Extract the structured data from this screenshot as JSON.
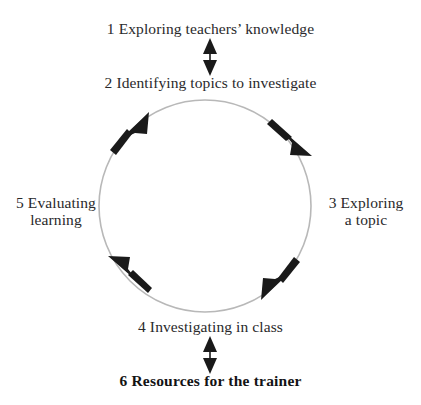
{
  "diagram": {
    "type": "cyclical-process",
    "colors": {
      "background": "#ffffff",
      "circle_stroke": "#b8b8b8",
      "arrow_fill": "#1a1a1a",
      "text": "#29292b",
      "text_emphasis": "#131314"
    },
    "circle": {
      "center_x": 205,
      "center_y": 206,
      "radius": 106,
      "direction": "clockwise",
      "arrowhead_angles_deg": [
        315,
        45,
        135,
        225
      ]
    },
    "steps": [
      {
        "number": "1",
        "label": "1 Exploring teachers’ knowledge",
        "position": "top",
        "emphasis": "regular"
      },
      {
        "number": "2",
        "label": "2 Identifying topics to investigate",
        "position": "upper",
        "emphasis": "regular"
      },
      {
        "number": "3",
        "label": "3 Exploring\na topic",
        "position": "right",
        "emphasis": "regular"
      },
      {
        "number": "4",
        "label": "4 Investigating in class",
        "position": "bottom",
        "emphasis": "regular"
      },
      {
        "number": "5",
        "label": "5 Evaluating\nlearning",
        "position": "left",
        "emphasis": "regular"
      },
      {
        "number": "6",
        "label": "6 Resources for the trainer",
        "position": "below-bottom",
        "emphasis": "bold"
      }
    ],
    "connectors": [
      {
        "name": "connector-1-2",
        "from": "1 Exploring teachers’ knowledge",
        "to": "2 Identifying topics to investigate",
        "style": "double-headed-vertical-arrow"
      },
      {
        "name": "connector-4-6",
        "from": "4 Investigating in class",
        "to": "6 Resources for the trainer",
        "style": "double-headed-vertical-arrow"
      }
    ]
  }
}
